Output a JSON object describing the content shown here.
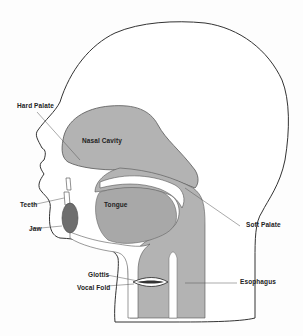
{
  "diagram": {
    "colors": {
      "tissue_fill": "#b3b3b3",
      "jaw_fill": "#6e6e6e",
      "outline": "#333333",
      "background": "#fdfdfd"
    },
    "labels": {
      "hard_palate": "Hard Palate",
      "nasal_cavity": "Nasal Cavity",
      "teeth": "Teeth",
      "tongue": "Tongue",
      "jaw": "Jaw",
      "soft_palate": "Soft Palate",
      "glottis": "Glottis",
      "vocal_fold": "Vocal Fold",
      "esophagus": "Esophagus"
    }
  }
}
